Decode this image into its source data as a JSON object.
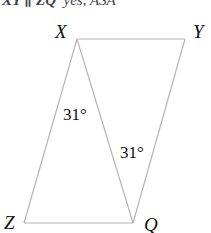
{
  "header": {
    "fragment_left": "XY ∥ ZQ",
    "fragment_right": "yes, ASA"
  },
  "diagram": {
    "vertices": {
      "X": {
        "label": "X",
        "x": 77,
        "y": 39
      },
      "Y": {
        "label": "Y",
        "x": 185,
        "y": 39
      },
      "Z": {
        "label": "Z",
        "x": 24,
        "y": 223
      },
      "Q": {
        "label": "Q",
        "x": 133,
        "y": 223
      }
    },
    "angles": [
      {
        "label": "31°",
        "at": "X",
        "between": [
          "XZ",
          "XQ"
        ]
      },
      {
        "label": "31°",
        "at": "Q",
        "between": [
          "QX",
          "QY"
        ]
      }
    ],
    "segments": [
      "XY",
      "YQ",
      "QZ",
      "ZX",
      "XQ"
    ],
    "line_color": "#b5b5b5"
  }
}
